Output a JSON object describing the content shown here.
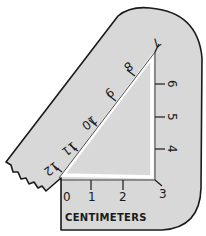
{
  "diagram": {
    "caption": "CENTIMETERS",
    "colors": {
      "ruler_fill": "#d8d8d8",
      "outline": "#1a1a1a",
      "background": "#ffffff",
      "triangle_border": "#ffffff"
    },
    "bottom_ticks": [
      "0",
      "1",
      "2",
      "3"
    ],
    "vertical_ticks": [
      "4",
      "5",
      "6"
    ],
    "hypotenuse_ticks": [
      "7",
      "8",
      "9",
      "10",
      "11",
      "12"
    ]
  }
}
